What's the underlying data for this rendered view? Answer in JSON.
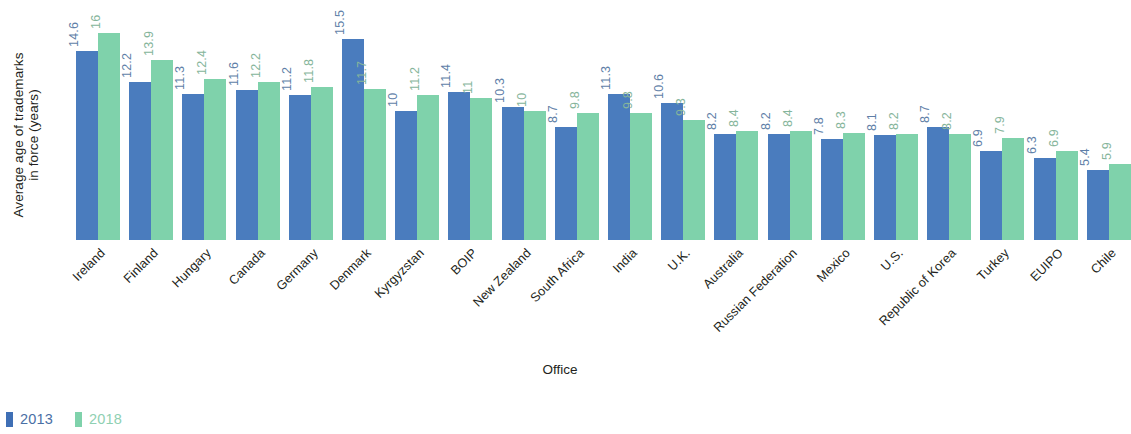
{
  "chart_data": {
    "type": "bar",
    "title": "",
    "xlabel": "Office",
    "ylabel": "Average age of trademarks\nin force (years)",
    "ylim": [
      0,
      18.5
    ],
    "grid": false,
    "legend_position": "bottom-left",
    "categories": [
      "Ireland",
      "Finland",
      "Hungary",
      "Canada",
      "Germany",
      "Denmark",
      "Kyrgyzstan",
      "BOIP",
      "New Zealand",
      "South Africa",
      "India",
      "U.K.",
      "Australia",
      "Russian Federation",
      "Mexico",
      "U.S.",
      "Republic of Korea",
      "Turkey",
      "EUIPO",
      "Chile"
    ],
    "series": [
      {
        "name": "2013",
        "color": "#4a7cbe",
        "values": [
          14.6,
          12.2,
          11.3,
          11.6,
          11.2,
          15.5,
          10,
          11.4,
          10.3,
          8.7,
          11.3,
          10.6,
          8.2,
          8.2,
          7.8,
          8.1,
          8.7,
          6.9,
          6.3,
          5.4
        ],
        "labels": [
          "14.6",
          "12.2",
          "11.3",
          "11.6",
          "11.2",
          "15.5",
          "10",
          "11.4",
          "10.3",
          "8.7",
          "11.3",
          "10.6",
          "8.2",
          "8.2",
          "7.8",
          "8.1",
          "8.7",
          "6.9",
          "6.3",
          "5.4"
        ]
      },
      {
        "name": "2018",
        "color": "#7fd2ab",
        "values": [
          16,
          13.9,
          12.4,
          12.2,
          11.8,
          11.7,
          11.2,
          11,
          10,
          9.8,
          9.8,
          9.3,
          8.4,
          8.4,
          8.3,
          8.2,
          8.2,
          7.9,
          6.9,
          5.9
        ],
        "labels": [
          "16",
          "13.9",
          "12.4",
          "12.2",
          "11.8",
          "11.7",
          "11.2",
          "11",
          "10",
          "9.8",
          "9.8",
          "9.3",
          "8.4",
          "8.4",
          "8.3",
          "8.2",
          "8.2",
          "7.9",
          "6.9",
          "5.9"
        ]
      }
    ]
  },
  "legend": {
    "items": [
      {
        "label": "2013",
        "color": "#3f6fb5"
      },
      {
        "label": "2018",
        "color": "#7fd2ab"
      }
    ]
  }
}
